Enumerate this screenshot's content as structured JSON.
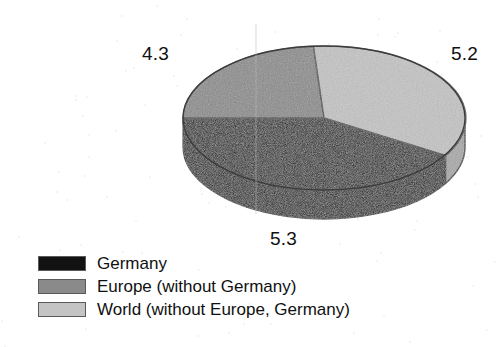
{
  "chart_data": {
    "type": "pie",
    "title": "",
    "subtitle": "",
    "xlabel": "",
    "ylabel": "",
    "three_d": true,
    "grid": false,
    "legend_position": "bottom-left",
    "categories": [
      "Germany",
      "Europe (without Germany)",
      "World (without Europe, Germany)"
    ],
    "values": [
      5.3,
      4.3,
      5.2
    ],
    "data_labels": [
      "5.3",
      "4.3",
      "5.2"
    ],
    "total": 14.8,
    "colors": [
      "#121212",
      "#8a8a8a",
      "#c4c4c4"
    ],
    "slices": [
      {
        "name": "Germany",
        "value": 5.3,
        "label": "5.3",
        "color": "#121212",
        "start_angle_deg": 180.0,
        "end_angle_deg": 308.9,
        "sweep_deg": 128.9,
        "percent": 35.8
      },
      {
        "name": "Europe (without Germany)",
        "value": 4.3,
        "label": "4.3",
        "color": "#8a8a8a",
        "start_angle_deg": 75.4,
        "end_angle_deg": 180.0,
        "sweep_deg": 104.6,
        "percent": 29.1
      },
      {
        "name": "World (without Europe, Germany)",
        "value": 5.2,
        "label": "5.2",
        "color": "#c4c4c4",
        "start_angle_deg": 308.9,
        "end_angle_deg": 435.4,
        "sweep_deg": 126.5,
        "percent": 35.1
      }
    ]
  },
  "labels": {
    "europe": "4.3",
    "world": "5.2",
    "germany": "5.3"
  },
  "legend": {
    "items": [
      {
        "label": "Germany",
        "color": "#121212"
      },
      {
        "label": "Europe (without Germany)",
        "color": "#8a8a8a"
      },
      {
        "label": "World (without Europe, Germany)",
        "color": "#c4c4c4"
      }
    ]
  },
  "colors": {
    "background": "#ffffff",
    "outline": "#3a3a3a",
    "text": "#101010",
    "germany": "#121212",
    "europe": "#8a8a8a",
    "world": "#c4c4c4",
    "germany_side": "#0c0c0c",
    "europe_side": "#6e6e6e",
    "world_side": "#a8a8a8"
  }
}
